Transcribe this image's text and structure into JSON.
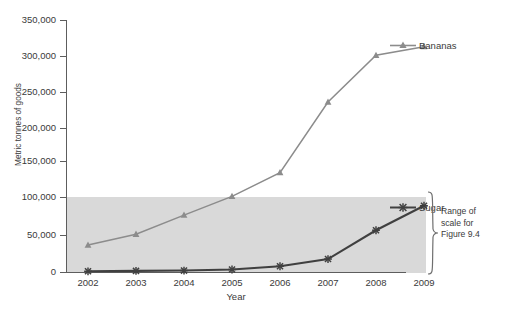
{
  "chart_data": {
    "type": "line",
    "title": "",
    "xlabel": "Year",
    "ylabel": "Metric tonnes of goods",
    "categories": [
      "2002",
      "2003",
      "2004",
      "2005",
      "2006",
      "2007",
      "2008",
      "2009"
    ],
    "x": [
      2002,
      2003,
      2004,
      2005,
      2006,
      2007,
      2008,
      2009
    ],
    "ylim": [
      0,
      350000
    ],
    "yticks": [
      0,
      50000,
      100000,
      150000,
      200000,
      250000,
      300000,
      350000
    ],
    "ytick_labels": [
      "0",
      "50,000",
      "100,000",
      "150,000",
      "200,000",
      "250,000",
      "300,000",
      "350,000"
    ],
    "grid": false,
    "legend_position": "right",
    "series": [
      {
        "name": "Bananas",
        "color": "#8c8c8c",
        "marker": "triangle",
        "values": [
          37500,
          52500,
          79000,
          105000,
          138000,
          236000,
          301000,
          313000
        ]
      },
      {
        "name": "Sugar",
        "color": "#404040",
        "marker": "x",
        "values": [
          1000,
          1500,
          2000,
          3500,
          8000,
          18000,
          58000,
          92000
        ]
      }
    ],
    "shaded_region": {
      "label": "Range of scale for Figure 9.4",
      "y_from": 0,
      "y_to": 100000,
      "color": "#d9d9d9"
    },
    "annotations": [
      {
        "text": "Range of scale for Figure 9.4",
        "lines": [
          "Range of",
          "scale for",
          "Figure 9.4"
        ]
      }
    ]
  },
  "axes": {
    "y_title": "Metric tonnes of goods",
    "x_title": "Year",
    "y_tick_labels": [
      "350,000",
      "300,000",
      "250,000",
      "200,000",
      "150,000",
      "100,000",
      "50,000",
      "0"
    ],
    "x_tick_labels": [
      "2002",
      "2003",
      "2004",
      "2005",
      "2006",
      "2007",
      "2008",
      "2009"
    ]
  },
  "legend": {
    "bananas_label": "Bananas",
    "sugar_label": "Sugar"
  },
  "annotation": {
    "line1": "Range of",
    "line2": "scale for",
    "line3": "Figure 9.4"
  },
  "footnote": {
    "text": ""
  },
  "colors": {
    "bananas": "#8c8c8c",
    "sugar": "#404040",
    "band": "#d9d9d9",
    "axis": "#5d5d5d",
    "text": "#3a3a3a"
  }
}
